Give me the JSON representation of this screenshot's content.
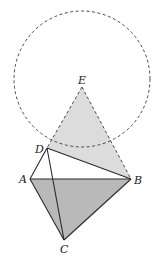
{
  "diagram": {
    "type": "geometry",
    "colors": {
      "line": "#2a2a2a",
      "dashed": "#4a4a4a",
      "light_fill": "#dcdcdc",
      "dark_fill": "#b9b9b9",
      "background": "#ffffff"
    },
    "circle": {
      "center_label": "E",
      "dashed": true
    },
    "points": {
      "E": {
        "label": "E"
      },
      "D": {
        "label": "D"
      },
      "A": {
        "label": "A"
      },
      "B": {
        "label": "B"
      },
      "C": {
        "label": "C"
      }
    },
    "segments": [
      {
        "from": "A",
        "to": "B",
        "style": "solid"
      },
      {
        "from": "A",
        "to": "D",
        "style": "solid"
      },
      {
        "from": "A",
        "to": "C",
        "style": "solid"
      },
      {
        "from": "B",
        "to": "C",
        "style": "solid"
      },
      {
        "from": "D",
        "to": "C",
        "style": "solid"
      },
      {
        "from": "D",
        "to": "B",
        "style": "solid"
      },
      {
        "from": "E",
        "to": "D",
        "style": "dashed"
      },
      {
        "from": "E",
        "to": "B",
        "style": "dashed"
      }
    ],
    "shaded_regions": [
      {
        "vertices": [
          "E",
          "D",
          "B"
        ],
        "shade": "light"
      },
      {
        "vertices": [
          "A",
          "B",
          "C"
        ],
        "shade": "dark"
      }
    ]
  }
}
